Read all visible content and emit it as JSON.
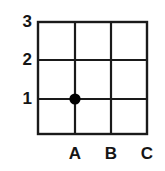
{
  "figure": {
    "name": "coordinate-grid-with-plotted-point",
    "background_color": "#ffffff",
    "line_color": "#1a1a1a",
    "point_color": "#000000"
  },
  "chart_data": {
    "type": "scatter",
    "title": "",
    "xlabel": "",
    "ylabel": "",
    "grid": true,
    "legend": false,
    "x_categories": [
      "A",
      "B",
      "C"
    ],
    "y_ticks": [
      "3",
      "2",
      "1"
    ],
    "y_ticks_numeric": [
      3,
      2,
      1
    ],
    "xlim": [
      "A",
      "C"
    ],
    "ylim": [
      0,
      3
    ],
    "points": [
      {
        "x": "A",
        "y": 1,
        "label": "",
        "marker": "filled-circle"
      }
    ],
    "series": [
      {
        "name": "plotted-point",
        "x": [
          "A"
        ],
        "values": [
          1
        ]
      }
    ]
  },
  "geometry": {
    "grid_left": 38,
    "grid_right": 147,
    "grid_top": 22,
    "grid_bottom": 134,
    "vertical_lines_x": [
      38,
      75,
      111,
      147
    ],
    "horizontal_lines_y": [
      22,
      60,
      99,
      134
    ],
    "point_cx": 75,
    "point_cy": 99,
    "point_r": 5.6
  },
  "y_axis": {
    "labels": [
      {
        "text": "3",
        "y": 22
      },
      {
        "text": "2",
        "y": 60
      },
      {
        "text": "1",
        "y": 99
      }
    ]
  },
  "x_axis": {
    "labels": [
      {
        "text": "A",
        "x": 75
      },
      {
        "text": "B",
        "x": 111
      },
      {
        "text": "C",
        "x": 147
      }
    ]
  }
}
